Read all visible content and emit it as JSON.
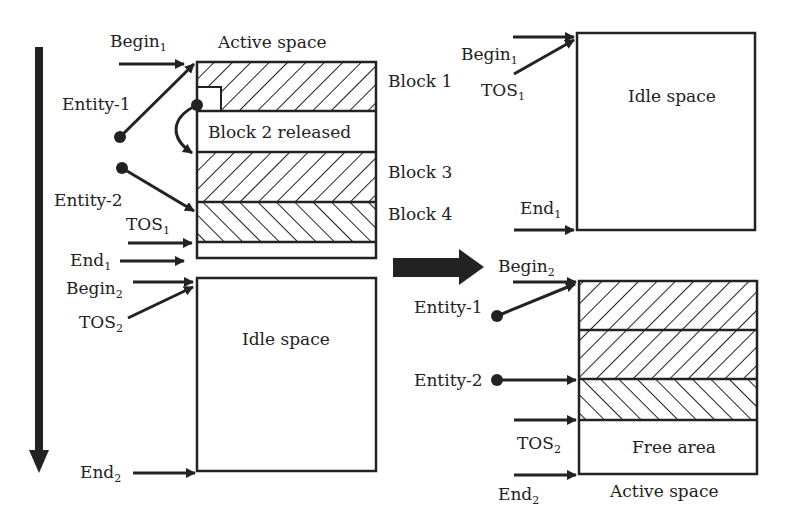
{
  "left": {
    "top_label": "Active space",
    "blocks": [
      {
        "name": "Block 1",
        "label": "Block 1"
      },
      {
        "name": "Block 2",
        "label": "Block 2 released"
      },
      {
        "name": "Block 3",
        "label": "Block 3"
      },
      {
        "name": "Block 4",
        "label": "Block 4"
      }
    ],
    "idle_label": "Idle space",
    "pointers": {
      "begin1": {
        "base": "Begin",
        "sub": "1"
      },
      "tos1": {
        "base": "TOS",
        "sub": "1"
      },
      "end1": {
        "base": "End",
        "sub": "1"
      },
      "begin2": {
        "base": "Begin",
        "sub": "2"
      },
      "tos2": {
        "base": "TOS",
        "sub": "2"
      },
      "end2": {
        "base": "End",
        "sub": "2"
      }
    },
    "entities": [
      "Entity-1",
      "Entity-2"
    ]
  },
  "right": {
    "idle_label": "Idle space",
    "free_label": "Free area",
    "bottom_label": "Active space",
    "pointers": {
      "begin1": {
        "base": "Begin",
        "sub": "1"
      },
      "tos1": {
        "base": "TOS",
        "sub": "1"
      },
      "end1": {
        "base": "End",
        "sub": "1"
      },
      "begin2": {
        "base": "Begin",
        "sub": "2"
      },
      "tos2": {
        "base": "TOS",
        "sub": "2"
      },
      "end2": {
        "base": "End",
        "sub": "2"
      }
    },
    "entities": [
      "Entity-1",
      "Entity-2"
    ]
  },
  "colors": {
    "ink": "#222222",
    "background": "#ffffff"
  }
}
